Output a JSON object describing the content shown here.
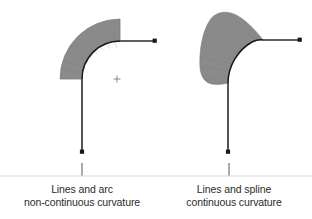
{
  "figure": {
    "background_color": "#ffffff",
    "comb_fill_color": "#8a8a8a",
    "comb_stroke_color": "#7d7d7d",
    "curve_color": "#1a1a1a",
    "line_color": "#2a2a2a",
    "divider_color": "#d8d8d8",
    "text_color": "#2b2b2b",
    "panels": [
      {
        "id": "left",
        "title_line1": "Lines and arc",
        "title_line2": "non-continuous curvature",
        "curve_type": "arc",
        "comb_description": "uniform-width curvature comb band (constant curvature)",
        "center_marker": "plus-marker",
        "horizontal_line": {
          "x1": 120,
          "y1": 41,
          "x2": 155,
          "y2": 41
        },
        "vertical_line": {
          "x1": 82,
          "y1": 83,
          "x2": 82,
          "y2": 152
        },
        "arc": {
          "cx": 120,
          "cy": 79,
          "r": 38,
          "start_deg": 180,
          "end_deg": 270
        },
        "comb_outer_radius": 60,
        "endpoint_dots": [
          {
            "x": 155,
            "y": 41
          },
          {
            "x": 82,
            "y": 152
          }
        ],
        "center_point": {
          "x": 117,
          "y": 79
        },
        "caption_x": 82,
        "caption_y1": 193,
        "caption_y2": 206
      },
      {
        "id": "right",
        "title_line1": "Lines and spline",
        "title_line2": "continuous curvature",
        "curve_type": "spline",
        "comb_description": "teardrop curvature comb, widest near the top-left (varying curvature)",
        "center_marker": "none",
        "horizontal_line": {
          "x1": 263,
          "y1": 40,
          "x2": 300,
          "y2": 40
        },
        "vertical_line": {
          "x1": 228,
          "y1": 83,
          "x2": 228,
          "y2": 152
        },
        "endpoint_dots": [
          {
            "x": 300,
            "y": 40
          },
          {
            "x": 228,
            "y": 152
          }
        ],
        "caption_x": 234,
        "caption_y1": 193,
        "caption_y2": 206
      }
    ],
    "divider": {
      "x1": 0,
      "y1": 176,
      "x2": 312,
      "y2": 176
    },
    "panel_ticks": [
      {
        "x": 82,
        "y1": 163,
        "y2": 176
      },
      {
        "x": 229,
        "y1": 163,
        "y2": 176
      }
    ]
  }
}
